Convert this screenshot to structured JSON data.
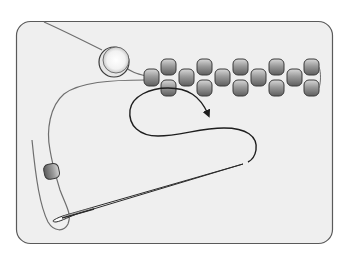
{
  "diagram": {
    "type": "beading-technique-illustration",
    "description": "Thread path for adding a bead in a two-drop / ladder-style bead strip, with a needle and stop bead",
    "colors": {
      "page_background": "#ffffff",
      "panel_background": "#efefef",
      "panel_border": "#5a5a5a",
      "thread": "#6e6e6e",
      "working_thread": "#1e1e1e",
      "bead_fill_light": "#c8c8c8",
      "bead_fill_dark": "#6a6a6a",
      "bead_outline": "#3a3a3a",
      "pearl_fill": "#ffffff",
      "needle_fill": "#ffffff",
      "needle_outline": "#2a2a2a"
    },
    "elements": {
      "panel": {
        "label": "Illustration frame"
      },
      "large_bead": {
        "label": "Large round bead"
      },
      "bead_strip": {
        "label": "Row of seed beads",
        "columns": 10
      },
      "stop_bead": {
        "label": "Stop bead on tail"
      },
      "needle": {
        "label": "Beading needle"
      },
      "arrow": {
        "label": "Direction of thread path"
      }
    }
  }
}
